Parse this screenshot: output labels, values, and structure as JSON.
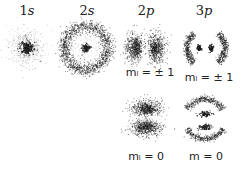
{
  "orbitals": [
    {
      "name": "1s",
      "num": "1",
      "letter": "s"
    },
    {
      "name": "2s",
      "num": "2",
      "letter": "s"
    },
    {
      "name": "2p",
      "num": "2",
      "letter": "p"
    },
    {
      "name": "3p",
      "num": "3",
      "letter": "p"
    }
  ],
  "labels": {
    "2p_ml_pm1": "mₗ = ± 1",
    "3p_ml_pm1": "mₗ = ± 1",
    "2p_ml_0": "mₗ = 0",
    "3p_m_0": "m = 0"
  },
  "colors": {
    "dot": "#1a1a1a",
    "text": "#222222",
    "background": "#ffffff"
  }
}
